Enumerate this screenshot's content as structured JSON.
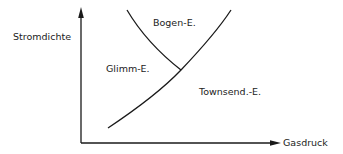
{
  "diagram": {
    "y_axis_label": "Stromdichte",
    "x_axis_label": "Gasdruck",
    "regions": {
      "arc": "Bogen-E.",
      "glow": "Glimm-E.",
      "townsend": "Townsend.-E."
    },
    "colors": {
      "line": "#1a1a1a",
      "text": "#222222",
      "background": "#ffffff"
    }
  }
}
